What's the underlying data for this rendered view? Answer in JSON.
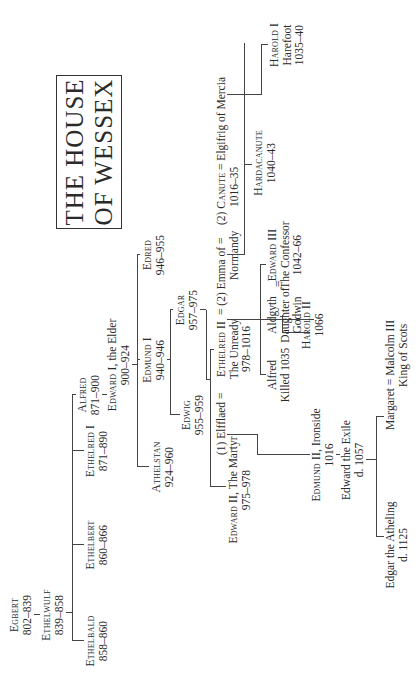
{
  "title": {
    "line1": "THE HOUSE",
    "line2": "OF WESSEX"
  },
  "people": {
    "egbert": {
      "name": "Egbert",
      "dates": "802–839"
    },
    "ethelwulf": {
      "name": "Ethelwulf",
      "dates": "839–858"
    },
    "ethelbald": {
      "name": "Ethelbald",
      "dates": "858–860"
    },
    "ethelbert": {
      "name": "Ethelbert",
      "dates": "860–866"
    },
    "ethelred1": {
      "name": "Ethelred I",
      "dates": "871–890"
    },
    "alfred": {
      "name": "Alfred",
      "dates": "871–900"
    },
    "edward1": {
      "name": "Edward I,",
      "epithet": "the Elder",
      "dates": "900–924"
    },
    "athelstan": {
      "name": "Athelstan",
      "dates": "924–960"
    },
    "edmund1": {
      "name": "Edmund I",
      "dates": "940–946"
    },
    "edred": {
      "name": "Edred",
      "dates": "946–955"
    },
    "edwig": {
      "name": "Edwig",
      "dates": "955–959"
    },
    "edgar": {
      "name": "Edgar",
      "dates": "957–975"
    },
    "edward2": {
      "name": "Edward II,",
      "epithet": "The Martyr",
      "dates": "975–978"
    },
    "elfflaed": {
      "label": "(1) Elfflaed ="
    },
    "ethelred2": {
      "name": "Ethelred II",
      "epithet": "The Unready",
      "dates": "978–1016"
    },
    "emma": {
      "label": "= (2) Emma of =",
      "line2": "Normandy"
    },
    "canute": {
      "prefix": "(2)",
      "name": "Canute",
      "dates": "1016–35"
    },
    "elgifrig": {
      "label": "= Elgifrig of Mercia"
    },
    "edmund2": {
      "name": "Edmund II,",
      "epithet": "Ironside",
      "dates": "1016"
    },
    "edward_exile": {
      "name": "Edward the Exile",
      "dates": "d. 1057"
    },
    "alfred2": {
      "name": "Alfred",
      "dates": "Killed 1035"
    },
    "harold2": {
      "name": "Harold II",
      "dates": "1066"
    },
    "aldgyth": {
      "name": "Aldgyth",
      "line2": "Daughter of",
      "line3": "Godwin"
    },
    "eq_aldgyth": {
      "label": "="
    },
    "edward3": {
      "name": "Edward III",
      "epithet": "The Confessor",
      "dates": "1042–66"
    },
    "hardacanute": {
      "name": "Hardacanute",
      "dates": "1040–43"
    },
    "harold1": {
      "name": "Harold I",
      "epithet": "Harefoot",
      "dates": "1035–40"
    },
    "edgar_atheling": {
      "name": "Edgar the Atheling",
      "dates": "d. 1125"
    },
    "margaret": {
      "label": "Margaret = Malcolm III",
      "line2": "King of Scots"
    }
  }
}
